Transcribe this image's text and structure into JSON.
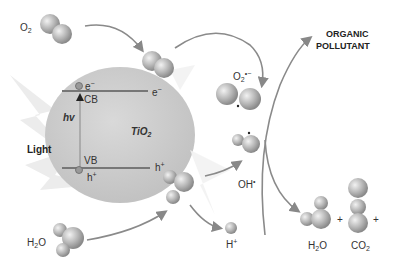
{
  "diagram": {
    "labels": {
      "o2": {
        "base": "O",
        "sub": "2"
      },
      "h2o_left": {
        "base": "H",
        "sub": "2",
        "tail": "O"
      },
      "light": "Light",
      "hv": "hv",
      "tio2": {
        "base": "TiO",
        "sub": "2"
      },
      "cb": "CB",
      "vb": "VB",
      "e_cb": {
        "base": "e",
        "sup": "−"
      },
      "e_out": {
        "base": "e",
        "sup": "−"
      },
      "h_vb": {
        "base": "h",
        "sup": "+"
      },
      "h_out": {
        "base": "h",
        "sup": "+"
      },
      "superoxide": {
        "base": "O",
        "sub": "2",
        "sup": "•−"
      },
      "hydroxyl": {
        "base": "OH",
        "sup": "•"
      },
      "proton": {
        "base": "H",
        "sup": "+"
      },
      "organic_pollutant_line1": "ORGANIC",
      "organic_pollutant_line2": "POLLUTANT",
      "product_h2o": {
        "base": "H",
        "sub": "2",
        "tail": "O"
      },
      "product_co2": {
        "base": "CO",
        "sub": "2"
      },
      "plus1": "+",
      "plus2": "+"
    },
    "colors": {
      "particle": "#c8c8c8",
      "band_line": "#777777",
      "arrow": "#8a8a8a",
      "molecule_light": "#e6e6e6",
      "molecule_dark": "#8c8c8c"
    }
  }
}
